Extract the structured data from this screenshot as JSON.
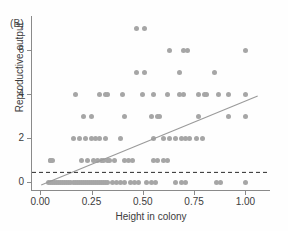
{
  "figure": {
    "panel_label": "(B)",
    "marker_color": "#a6a6a6",
    "line_color": "#9a9a9a",
    "axis_color": "#8a8a8a"
  },
  "chart_data": {
    "type": "scatter",
    "title": "",
    "panel": "(B)",
    "xlabel": "Height in colony",
    "ylabel": "Reproductive output",
    "xlim": [
      -0.04,
      1.12
    ],
    "ylim": [
      -0.35,
      7.55
    ],
    "xticks": [
      0.0,
      0.25,
      0.5,
      0.75,
      1.0
    ],
    "xtick_labels": [
      "0.00",
      "0.25",
      "0.50",
      "0.75",
      "1.00"
    ],
    "yticks": [
      0,
      2,
      4,
      6
    ],
    "ytick_labels": [
      "0",
      "2",
      "4",
      "6"
    ],
    "grid": false,
    "legend": null,
    "annotations": [
      {
        "kind": "regression-line",
        "x0": 0.005,
        "y0": -0.12,
        "x1": 1.06,
        "y1": 3.92,
        "style": "solid",
        "color": "#9a9a9a"
      },
      {
        "kind": "threshold-line",
        "y": 0.45,
        "style": "dashed",
        "color": "#2b2b2b",
        "x0": -0.04,
        "x1": 1.12
      }
    ],
    "points": [
      [
        0.05,
        1
      ],
      [
        0.06,
        1
      ],
      [
        0.17,
        4
      ],
      [
        0.29,
        4
      ],
      [
        0.32,
        4
      ],
      [
        0.33,
        4
      ],
      [
        0.4,
        4
      ],
      [
        0.5,
        4
      ],
      [
        0.55,
        4
      ],
      [
        0.62,
        4
      ],
      [
        0.68,
        4
      ],
      [
        0.7,
        4
      ],
      [
        0.77,
        4
      ],
      [
        0.8,
        4
      ],
      [
        0.81,
        4
      ],
      [
        0.87,
        4
      ],
      [
        0.92,
        4
      ],
      [
        1.0,
        4
      ],
      [
        0.47,
        7
      ],
      [
        0.51,
        7
      ],
      [
        0.63,
        6
      ],
      [
        0.7,
        6
      ],
      [
        0.72,
        6
      ],
      [
        1.0,
        6
      ],
      [
        0.47,
        5
      ],
      [
        0.51,
        5
      ],
      [
        0.68,
        5
      ],
      [
        0.85,
        5
      ],
      [
        0.21,
        3
      ],
      [
        0.25,
        3
      ],
      [
        0.41,
        3
      ],
      [
        0.54,
        3
      ],
      [
        0.57,
        3
      ],
      [
        0.58,
        3
      ],
      [
        0.77,
        3
      ],
      [
        0.92,
        3
      ],
      [
        1.0,
        3
      ],
      [
        0.16,
        2
      ],
      [
        0.19,
        2
      ],
      [
        0.22,
        2
      ],
      [
        0.25,
        2
      ],
      [
        0.27,
        2
      ],
      [
        0.29,
        2
      ],
      [
        0.32,
        2
      ],
      [
        0.39,
        2
      ],
      [
        0.55,
        2
      ],
      [
        0.6,
        2
      ],
      [
        0.63,
        2
      ],
      [
        0.66,
        2
      ],
      [
        0.69,
        2
      ],
      [
        0.71,
        2
      ],
      [
        0.73,
        2
      ],
      [
        0.76,
        2
      ],
      [
        0.79,
        2
      ],
      [
        0.05,
        1
      ],
      [
        0.2,
        1
      ],
      [
        0.23,
        1
      ],
      [
        0.26,
        1
      ],
      [
        0.28,
        1
      ],
      [
        0.3,
        1
      ],
      [
        0.31,
        1
      ],
      [
        0.33,
        1
      ],
      [
        0.34,
        1
      ],
      [
        0.36,
        1
      ],
      [
        0.41,
        1
      ],
      [
        0.43,
        1
      ],
      [
        0.45,
        1
      ],
      [
        0.55,
        1
      ],
      [
        0.57,
        1
      ],
      [
        0.6,
        1
      ],
      [
        0.62,
        1
      ],
      [
        0.04,
        0
      ],
      [
        0.05,
        0
      ],
      [
        0.06,
        0
      ],
      [
        0.07,
        0
      ],
      [
        0.08,
        0
      ],
      [
        0.09,
        0
      ],
      [
        0.1,
        0
      ],
      [
        0.11,
        0
      ],
      [
        0.12,
        0
      ],
      [
        0.13,
        0
      ],
      [
        0.14,
        0
      ],
      [
        0.15,
        0
      ],
      [
        0.16,
        0
      ],
      [
        0.17,
        0
      ],
      [
        0.18,
        0
      ],
      [
        0.19,
        0
      ],
      [
        0.2,
        0
      ],
      [
        0.21,
        0
      ],
      [
        0.22,
        0
      ],
      [
        0.23,
        0
      ],
      [
        0.24,
        0
      ],
      [
        0.25,
        0
      ],
      [
        0.26,
        0
      ],
      [
        0.27,
        0
      ],
      [
        0.28,
        0
      ],
      [
        0.29,
        0
      ],
      [
        0.3,
        0
      ],
      [
        0.31,
        0
      ],
      [
        0.32,
        0
      ],
      [
        0.33,
        0
      ],
      [
        0.35,
        0
      ],
      [
        0.37,
        0
      ],
      [
        0.39,
        0
      ],
      [
        0.41,
        0
      ],
      [
        0.44,
        0
      ],
      [
        0.46,
        0
      ],
      [
        0.48,
        0
      ],
      [
        0.52,
        0
      ],
      [
        0.54,
        0
      ],
      [
        0.56,
        0
      ],
      [
        0.66,
        0
      ],
      [
        0.69,
        0
      ],
      [
        0.71,
        0
      ],
      [
        0.86,
        0
      ],
      [
        0.88,
        0
      ],
      [
        1.0,
        0
      ]
    ]
  }
}
